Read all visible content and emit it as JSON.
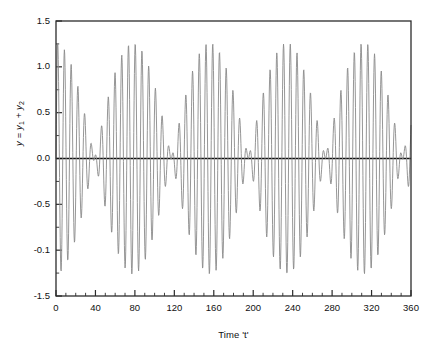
{
  "chart_data": {
    "type": "line",
    "title": "",
    "xlabel": "Time 't'",
    "ylabel": "y = y1 + y2",
    "ylabel_parts": {
      "lead": "y",
      "eq": " = ",
      "y1": "y",
      "sub1": "1",
      "plus": " + ",
      "y2": "y",
      "sub2": "2"
    },
    "xlim": [
      0,
      360
    ],
    "ylim": [
      -1.5,
      1.5
    ],
    "xticks": [
      0,
      40,
      80,
      120,
      160,
      200,
      240,
      280,
      320,
      360
    ],
    "xtick_labels": [
      "0",
      "40",
      "80",
      "120",
      "160",
      "200",
      "240",
      "280",
      "320",
      "360"
    ],
    "yticks": [
      1.5,
      1.0,
      0.5,
      0.0,
      -0.5,
      -1.0,
      -1.5
    ],
    "ytick_labels": [
      "1.5",
      "1.0",
      "0.5",
      "0.0",
      "-0.5",
      "-0.1",
      "-1.5"
    ],
    "x_minor_per_major": 4,
    "y_minor_per_major": 2,
    "grid": false,
    "legend": null,
    "zero_line": true,
    "zero_line_value": 0.0,
    "series": [
      {
        "name": "y = y1 + y2",
        "color": "#8a8a8a",
        "line_width": 0.9,
        "description": "Sum of two sinusoids of nearly equal frequency producing a beat (amplitude-modulated) waveform",
        "model": {
          "form": "y = A1*sin(2*pi*t/T1) + A2*sin(2*pi*t/T2)",
          "A1": 0.63,
          "A2": 0.63,
          "T1": 6.55,
          "T2": 7.15,
          "beat_period": 78.5,
          "carrier_period": 6.84,
          "n_samples": 1100
        },
        "envelope_peak_times": [
          2,
          80,
          158,
          237,
          315
        ],
        "envelope_node_times": [
          41,
          119,
          198,
          276,
          354
        ],
        "peak_amplitude": 1.26,
        "min_amplitude": -1.26
      }
    ],
    "colors": {
      "trace": "#8a8a8a",
      "axis": "#1a1a1a",
      "zero_line": "#111111",
      "background": "#ffffff",
      "text": "#111111"
    }
  },
  "figure": {
    "plot_left_px": 56,
    "plot_top_px": 21,
    "plot_right_px": 411,
    "plot_bottom_px": 296
  }
}
